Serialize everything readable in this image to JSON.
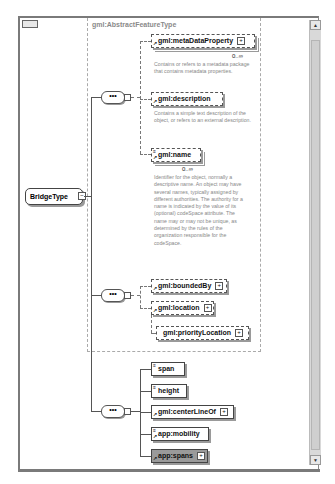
{
  "window": {
    "abstract_type_label": "gml:AbstractFeatureType"
  },
  "root": {
    "name": "BridgeType"
  },
  "sequence_glyph": "•••",
  "group1": {
    "elements": [
      {
        "name": "gml:metaDataProperty",
        "cardinality": "0..∞",
        "doc": "Contains or refers to a metadata package that contains metadata properties."
      },
      {
        "name": "gml:description",
        "doc": "Contains a simple text description of the object, or refers to an external description."
      },
      {
        "name": "gml:name",
        "cardinality": "0..∞",
        "doc": "Identifier for the object, normally a descriptive name. An object may have several names, typically assigned by different authorities.  The authority for a name is indicated by the value of its (optional) codeSpace attribute.  The name may or may not be unique, as determined by the rules of the organization responsible for the codeSpace."
      }
    ]
  },
  "group2": {
    "elements": [
      {
        "name": "gml:boundedBy"
      },
      {
        "name": "gml:location"
      },
      {
        "name": "gml:priorityLocation"
      }
    ]
  },
  "group3": {
    "elements": [
      {
        "name": "span"
      },
      {
        "name": "height"
      },
      {
        "name": "gml:centerLineOf"
      },
      {
        "name": "app:mobility"
      },
      {
        "name": "app:spans"
      }
    ]
  },
  "icons": {
    "expand": "+",
    "collapse": "−",
    "scroll_up": "▲",
    "scroll_down": "▼"
  }
}
